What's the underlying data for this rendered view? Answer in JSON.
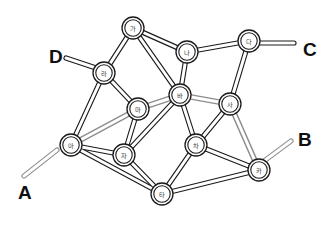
{
  "figure": {
    "type": "node-link-diagram",
    "background_color": "#ffffff",
    "edge_color": "#1a1a1a",
    "highlight_color": "#8d8d8d",
    "node_fill": "#ffffff"
  },
  "terminals": [
    {
      "id": "A",
      "label": "A",
      "x": 18,
      "y": 183,
      "stub_from": [
        57,
        150
      ],
      "stub_to": [
        24,
        176
      ]
    },
    {
      "id": "B",
      "label": "B",
      "x": 298,
      "y": 130,
      "stub_from": [
        256,
        167
      ],
      "stub_to": [
        291,
        141
      ]
    },
    {
      "id": "C",
      "label": "C",
      "x": 303,
      "y": 40,
      "stub_from": [
        259,
        43
      ],
      "stub_to": [
        294,
        43
      ]
    },
    {
      "id": "D",
      "label": "D",
      "x": 49,
      "y": 47,
      "stub_from": [
        102,
        70
      ],
      "stub_to": [
        66,
        58
      ]
    }
  ],
  "nodes": [
    {
      "id": "ga",
      "label": "가",
      "x": 133,
      "y": 28,
      "highlighted": false
    },
    {
      "id": "na",
      "label": "나",
      "x": 187,
      "y": 52,
      "highlighted": false
    },
    {
      "id": "da",
      "label": "다",
      "x": 249,
      "y": 41,
      "highlighted": false
    },
    {
      "id": "ra",
      "label": "라",
      "x": 104,
      "y": 73,
      "highlighted": false
    },
    {
      "id": "ma",
      "label": "마",
      "x": 138,
      "y": 109,
      "highlighted": true
    },
    {
      "id": "ba",
      "label": "바",
      "x": 180,
      "y": 95,
      "highlighted": true
    },
    {
      "id": "sa",
      "label": "사",
      "x": 230,
      "y": 104,
      "highlighted": true
    },
    {
      "id": "a",
      "label": "아",
      "x": 71,
      "y": 145,
      "highlighted": true
    },
    {
      "id": "ja",
      "label": "자",
      "x": 124,
      "y": 155,
      "highlighted": false
    },
    {
      "id": "cha",
      "label": "차",
      "x": 196,
      "y": 145,
      "highlighted": false
    },
    {
      "id": "ka",
      "label": "카",
      "x": 259,
      "y": 170,
      "highlighted": true
    },
    {
      "id": "ta",
      "label": "타",
      "x": 162,
      "y": 194,
      "highlighted": false
    }
  ],
  "edges": [
    {
      "from": "ga",
      "to": "na",
      "highlighted": false
    },
    {
      "from": "ga",
      "to": "ra",
      "highlighted": false
    },
    {
      "from": "ga",
      "to": "ba",
      "highlighted": false
    },
    {
      "from": "na",
      "to": "da",
      "highlighted": false
    },
    {
      "from": "na",
      "to": "ba",
      "highlighted": false
    },
    {
      "from": "da",
      "to": "sa",
      "highlighted": false
    },
    {
      "from": "ra",
      "to": "ma",
      "highlighted": false
    },
    {
      "from": "ra",
      "to": "a",
      "highlighted": false
    },
    {
      "from": "ma",
      "to": "ba",
      "highlighted": true
    },
    {
      "from": "ma",
      "to": "a",
      "highlighted": true
    },
    {
      "from": "ma",
      "to": "ja",
      "highlighted": false
    },
    {
      "from": "ba",
      "to": "sa",
      "highlighted": true
    },
    {
      "from": "ba",
      "to": "cha",
      "highlighted": false
    },
    {
      "from": "ba",
      "to": "ja",
      "highlighted": false
    },
    {
      "from": "sa",
      "to": "cha",
      "highlighted": false
    },
    {
      "from": "sa",
      "to": "ka",
      "highlighted": true
    },
    {
      "from": "a",
      "to": "ja",
      "highlighted": false
    },
    {
      "from": "a",
      "to": "ta",
      "highlighted": false
    },
    {
      "from": "ja",
      "to": "ta",
      "highlighted": false
    },
    {
      "from": "cha",
      "to": "ta",
      "highlighted": false
    },
    {
      "from": "cha",
      "to": "ka",
      "highlighted": false
    },
    {
      "from": "ta",
      "to": "ka",
      "highlighted": false
    }
  ],
  "highlighted_route": {
    "sequence": [
      "A",
      "아",
      "마",
      "바",
      "사",
      "카",
      "B"
    ]
  },
  "geometry": {
    "node_radius_outer": 11,
    "node_radius_inner": 8.2,
    "edge_outer_width": 5.2,
    "edge_inner_width": 3.0
  }
}
